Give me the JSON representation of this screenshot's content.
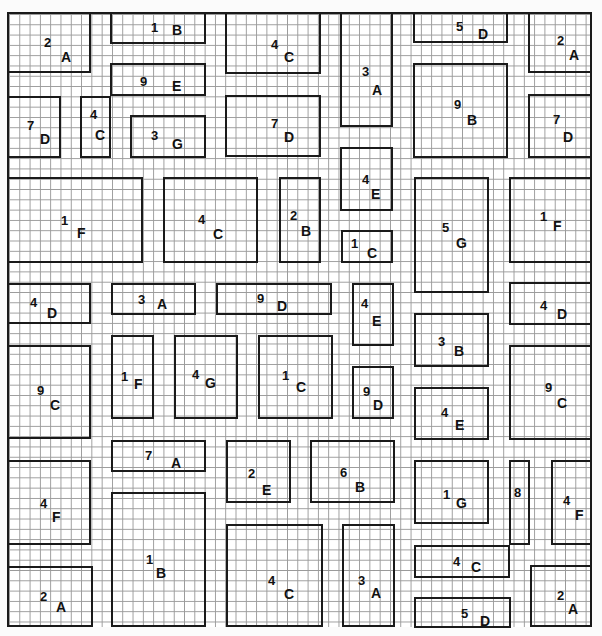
{
  "diagram": {
    "type": "grid-city-blocks",
    "grid_spacing_px": 10,
    "border_color": "#1a1a1a",
    "grid_color": "#9a9a9a",
    "blocks": [
      {
        "id": "b1",
        "num": "2",
        "letter": "A",
        "x": 7,
        "y": 12,
        "w": 84,
        "h": 61,
        "nx": 44,
        "ny": 36,
        "lx": 61,
        "ly": 50
      },
      {
        "id": "b2",
        "num": "1",
        "letter": "B",
        "x": 110,
        "y": 12,
        "w": 96,
        "h": 32,
        "nx": 151,
        "ny": 21,
        "lx": 172,
        "ly": 23
      },
      {
        "id": "b3",
        "num": "4",
        "letter": "C",
        "x": 225,
        "y": 12,
        "w": 96,
        "h": 62,
        "nx": 271,
        "ny": 38,
        "lx": 284,
        "ly": 50
      },
      {
        "id": "b4",
        "num": "3",
        "letter": "A",
        "x": 340,
        "y": 12,
        "w": 53,
        "h": 115,
        "nx": 362,
        "ny": 65,
        "lx": 372,
        "ly": 83
      },
      {
        "id": "b5",
        "num": "5",
        "letter": "D",
        "x": 413,
        "y": 12,
        "w": 95,
        "h": 31,
        "nx": 456,
        "ny": 20,
        "lx": 478,
        "ly": 27
      },
      {
        "id": "b6",
        "num": "2",
        "letter": "A",
        "x": 528,
        "y": 12,
        "w": 64,
        "h": 61,
        "nx": 557,
        "ny": 34,
        "lx": 569,
        "ly": 48
      },
      {
        "id": "b7",
        "num": "9",
        "letter": "E",
        "x": 110,
        "y": 63,
        "w": 96,
        "h": 33,
        "nx": 140,
        "ny": 75,
        "lx": 172,
        "ly": 79
      },
      {
        "id": "b8",
        "num": "7",
        "letter": "D",
        "x": 7,
        "y": 96,
        "w": 54,
        "h": 62,
        "nx": 27,
        "ny": 119,
        "lx": 40,
        "ly": 132
      },
      {
        "id": "b9",
        "num": "4",
        "letter": "C",
        "x": 80,
        "y": 96,
        "w": 31,
        "h": 62,
        "nx": 90,
        "ny": 108,
        "lx": 95,
        "ly": 128
      },
      {
        "id": "b10",
        "num": "3",
        "letter": "G",
        "x": 130,
        "y": 115,
        "w": 76,
        "h": 43,
        "nx": 151,
        "ny": 129,
        "lx": 172,
        "ly": 137
      },
      {
        "id": "b11",
        "num": "7",
        "letter": "D",
        "x": 225,
        "y": 95,
        "w": 96,
        "h": 62,
        "nx": 271,
        "ny": 117,
        "lx": 284,
        "ly": 130
      },
      {
        "id": "b12",
        "num": "9",
        "letter": "B",
        "x": 413,
        "y": 63,
        "w": 95,
        "h": 95,
        "nx": 454,
        "ny": 98,
        "lx": 467,
        "ly": 113
      },
      {
        "id": "b13",
        "num": "7",
        "letter": "D",
        "x": 528,
        "y": 94,
        "w": 64,
        "h": 64,
        "nx": 553,
        "ny": 113,
        "lx": 563,
        "ly": 130
      },
      {
        "id": "b14",
        "num": "4",
        "letter": "E",
        "x": 340,
        "y": 147,
        "w": 53,
        "h": 64,
        "nx": 362,
        "ny": 173,
        "lx": 371,
        "ly": 187
      },
      {
        "id": "b15",
        "num": "1",
        "letter": "F",
        "x": 7,
        "y": 177,
        "w": 136,
        "h": 86,
        "nx": 61,
        "ny": 214,
        "lx": 77,
        "ly": 226
      },
      {
        "id": "b16",
        "num": "4",
        "letter": "C",
        "x": 163,
        "y": 177,
        "w": 95,
        "h": 86,
        "nx": 198,
        "ny": 213,
        "lx": 213,
        "ly": 227
      },
      {
        "id": "b17",
        "num": "2",
        "letter": "B",
        "x": 279,
        "y": 177,
        "w": 42,
        "h": 86,
        "nx": 290,
        "ny": 209,
        "lx": 301,
        "ly": 224
      },
      {
        "id": "b18",
        "num": "1",
        "letter": "C",
        "x": 341,
        "y": 230,
        "w": 52,
        "h": 33,
        "nx": 351,
        "ny": 237,
        "lx": 367,
        "ly": 246
      },
      {
        "id": "b19",
        "num": "5",
        "letter": "G",
        "x": 414,
        "y": 177,
        "w": 75,
        "h": 116,
        "nx": 442,
        "ny": 221,
        "lx": 456,
        "ly": 236
      },
      {
        "id": "b20",
        "num": "1",
        "letter": "F",
        "x": 509,
        "y": 177,
        "w": 83,
        "h": 86,
        "nx": 540,
        "ny": 210,
        "lx": 553,
        "ly": 219
      },
      {
        "id": "b21",
        "num": "4",
        "letter": "D",
        "x": 7,
        "y": 283,
        "w": 84,
        "h": 41,
        "nx": 30,
        "ny": 296,
        "lx": 47,
        "ly": 306
      },
      {
        "id": "b22",
        "num": "3",
        "letter": "A",
        "x": 111,
        "y": 283,
        "w": 85,
        "h": 32,
        "nx": 138,
        "ny": 293,
        "lx": 157,
        "ly": 297
      },
      {
        "id": "b23",
        "num": "9",
        "letter": "D",
        "x": 216,
        "y": 283,
        "w": 116,
        "h": 32,
        "nx": 257,
        "ny": 292,
        "lx": 277,
        "ly": 299
      },
      {
        "id": "b24",
        "num": "4",
        "letter": "E",
        "x": 352,
        "y": 283,
        "w": 42,
        "h": 63,
        "nx": 361,
        "ny": 297,
        "lx": 372,
        "ly": 314
      },
      {
        "id": "b25",
        "num": "4",
        "letter": "D",
        "x": 509,
        "y": 282,
        "w": 83,
        "h": 43,
        "nx": 540,
        "ny": 299,
        "lx": 557,
        "ly": 307
      },
      {
        "id": "b26",
        "num": "3",
        "letter": "B",
        "x": 414,
        "y": 313,
        "w": 75,
        "h": 54,
        "nx": 438,
        "ny": 335,
        "lx": 454,
        "ly": 344
      },
      {
        "id": "b27",
        "num": "9",
        "letter": "C",
        "x": 7,
        "y": 345,
        "w": 84,
        "h": 94,
        "nx": 37,
        "ny": 384,
        "lx": 50,
        "ly": 398
      },
      {
        "id": "b28",
        "num": "1",
        "letter": "F",
        "x": 111,
        "y": 335,
        "w": 43,
        "h": 84,
        "nx": 121,
        "ny": 370,
        "lx": 134,
        "ly": 377
      },
      {
        "id": "b29",
        "num": "4",
        "letter": "G",
        "x": 174,
        "y": 335,
        "w": 64,
        "h": 84,
        "nx": 192,
        "ny": 368,
        "lx": 205,
        "ly": 376
      },
      {
        "id": "b30",
        "num": "1",
        "letter": "C",
        "x": 258,
        "y": 335,
        "w": 75,
        "h": 84,
        "nx": 282,
        "ny": 369,
        "lx": 296,
        "ly": 380
      },
      {
        "id": "b31",
        "num": "9",
        "letter": "D",
        "x": 352,
        "y": 366,
        "w": 42,
        "h": 53,
        "nx": 363,
        "ny": 385,
        "lx": 373,
        "ly": 398
      },
      {
        "id": "b32",
        "num": "4",
        "letter": "E",
        "x": 414,
        "y": 387,
        "w": 75,
        "h": 53,
        "nx": 441,
        "ny": 406,
        "lx": 455,
        "ly": 418
      },
      {
        "id": "b33",
        "num": "9",
        "letter": "C",
        "x": 509,
        "y": 345,
        "w": 83,
        "h": 95,
        "nx": 545,
        "ny": 381,
        "lx": 557,
        "ly": 396
      },
      {
        "id": "b34",
        "num": "7",
        "letter": "A",
        "x": 111,
        "y": 440,
        "w": 95,
        "h": 32,
        "nx": 145,
        "ny": 449,
        "lx": 171,
        "ly": 456
      },
      {
        "id": "b35",
        "num": "2",
        "letter": "E",
        "x": 226,
        "y": 440,
        "w": 65,
        "h": 63,
        "nx": 248,
        "ny": 467,
        "lx": 262,
        "ly": 483
      },
      {
        "id": "b36",
        "num": "6",
        "letter": "B",
        "x": 310,
        "y": 440,
        "w": 85,
        "h": 63,
        "nx": 340,
        "ny": 466,
        "lx": 355,
        "ly": 480
      },
      {
        "id": "b37",
        "num": "4",
        "letter": "F",
        "x": 7,
        "y": 460,
        "w": 84,
        "h": 85,
        "nx": 40,
        "ny": 497,
        "lx": 52,
        "ly": 510
      },
      {
        "id": "b38",
        "num": "1",
        "letter": "G",
        "x": 414,
        "y": 460,
        "w": 75,
        "h": 64,
        "nx": 443,
        "ny": 488,
        "lx": 456,
        "ly": 496
      },
      {
        "id": "b39",
        "num": "8",
        "letter": "",
        "x": 509,
        "y": 460,
        "w": 21,
        "h": 85,
        "nx": 514,
        "ny": 486,
        "lx": 0,
        "ly": 0
      },
      {
        "id": "b40",
        "num": "4",
        "letter": "F",
        "x": 551,
        "y": 460,
        "w": 41,
        "h": 85,
        "nx": 563,
        "ny": 494,
        "lx": 575,
        "ly": 508
      },
      {
        "id": "b41",
        "num": "1",
        "letter": "B",
        "x": 111,
        "y": 492,
        "w": 95,
        "h": 135,
        "nx": 146,
        "ny": 553,
        "lx": 156,
        "ly": 566
      },
      {
        "id": "b42",
        "num": "4",
        "letter": "C",
        "x": 226,
        "y": 524,
        "w": 97,
        "h": 103,
        "nx": 268,
        "ny": 574,
        "lx": 284,
        "ly": 587
      },
      {
        "id": "b43",
        "num": "3",
        "letter": "A",
        "x": 342,
        "y": 524,
        "w": 53,
        "h": 103,
        "nx": 358,
        "ny": 574,
        "lx": 371,
        "ly": 586
      },
      {
        "id": "b44",
        "num": "4",
        "letter": "C",
        "x": 414,
        "y": 545,
        "w": 96,
        "h": 33,
        "nx": 453,
        "ny": 555,
        "lx": 471,
        "ly": 560
      },
      {
        "id": "b45",
        "num": "2",
        "letter": "A",
        "x": 7,
        "y": 566,
        "w": 86,
        "h": 61,
        "nx": 40,
        "ny": 590,
        "lx": 56,
        "ly": 600
      },
      {
        "id": "b46",
        "num": "5",
        "letter": "D",
        "x": 414,
        "y": 597,
        "w": 97,
        "h": 31,
        "nx": 461,
        "ny": 607,
        "lx": 480,
        "ly": 614
      },
      {
        "id": "b47",
        "num": "2",
        "letter": "A",
        "x": 530,
        "y": 565,
        "w": 62,
        "h": 62,
        "nx": 557,
        "ny": 589,
        "lx": 568,
        "ly": 602
      }
    ]
  }
}
